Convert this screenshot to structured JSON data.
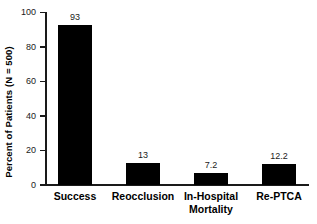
{
  "chart_data": {
    "type": "bar",
    "title": "",
    "xlabel": "",
    "ylabel": "Percent of Patients (N = 500)",
    "categories": [
      "Success",
      "Reocclusion",
      "In-Hospital Mortality",
      "Re-PTCA"
    ],
    "category_lines": [
      [
        "Success"
      ],
      [
        "Reocclusion"
      ],
      [
        "In-Hospital",
        "Mortality"
      ],
      [
        "Re-PTCA"
      ]
    ],
    "values": [
      93,
      13,
      7.2,
      12.2
    ],
    "value_labels": [
      "93",
      "13",
      "7.2",
      "12.2"
    ],
    "ylim": [
      0,
      100
    ],
    "yticks": [
      0,
      20,
      40,
      60,
      80,
      100
    ],
    "ytick_labels": [
      "0",
      "20",
      "40",
      "60",
      "80",
      "100"
    ],
    "grid": false,
    "legend": null,
    "bar_color": "#000000",
    "axis_color": "#1a1a1a",
    "background": "#ffffff"
  }
}
